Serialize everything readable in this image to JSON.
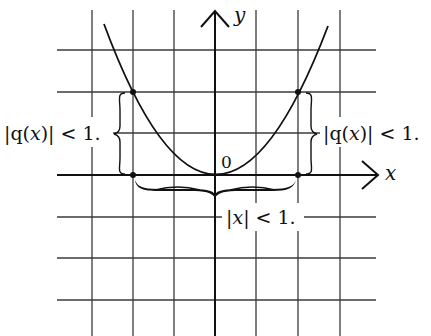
{
  "figure": {
    "axes": {
      "x_label": "x",
      "y_label": "y",
      "origin_label": "0"
    },
    "grid": {
      "vertical_x_px": [
        92,
        133,
        174,
        256,
        298,
        340
      ],
      "horizontal_y_px": [
        50,
        92,
        133,
        217,
        258,
        300
      ],
      "x_extent_px": [
        57,
        376
      ],
      "y_extent_px": [
        10,
        336
      ]
    },
    "curve": {
      "name": "q(x)",
      "shape": "parabola",
      "vertex": [
        0,
        0
      ],
      "marked_points": [
        {
          "x": -1,
          "y": 1
        },
        {
          "x": 1,
          "y": 1
        },
        {
          "x": -1,
          "y": 0
        },
        {
          "x": 1,
          "y": 0
        }
      ]
    },
    "annotations": {
      "left_bound": {
        "text_prefix": "|q(",
        "var": "x",
        "text_suffix": ")| < 1."
      },
      "right_bound": {
        "text_prefix": "|q(",
        "var": "x",
        "text_suffix": ")| < 1."
      },
      "x_bound": {
        "text_prefix": "|",
        "var": "x",
        "text_suffix": "| < 1."
      }
    }
  }
}
